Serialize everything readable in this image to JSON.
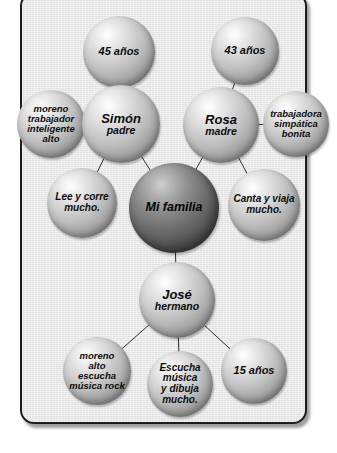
{
  "diagram": {
    "title": "Mi familia",
    "type": "family-mind-map",
    "language": "es",
    "panel": {
      "background_color": "#e9e9e9",
      "border_color": "#1c1c1c"
    },
    "nodes": [
      {
        "id": "age-father",
        "name": "age-father-bubble",
        "lines": [
          "45 años"
        ],
        "style": "light",
        "cx": 119,
        "cy": 52,
        "r": 36
      },
      {
        "id": "age-mother",
        "name": "age-mother-bubble",
        "lines": [
          "43 años"
        ],
        "style": "light",
        "cx": 245,
        "cy": 51,
        "r": 34
      },
      {
        "id": "traits-father",
        "name": "father-traits-bubble",
        "lines": [
          "moreno",
          "trabajador",
          "inteligente",
          "alto"
        ],
        "style": "light",
        "cx": 51,
        "cy": 124,
        "r": 34
      },
      {
        "id": "father",
        "name": "father-bubble",
        "lines": [
          "Simón",
          "padre"
        ],
        "style": "light",
        "cx": 121,
        "cy": 124,
        "r": 39
      },
      {
        "id": "mother",
        "name": "mother-bubble",
        "lines": [
          "Rosa",
          "madre"
        ],
        "style": "light",
        "cx": 221,
        "cy": 125,
        "r": 38
      },
      {
        "id": "traits-mother",
        "name": "mother-traits-bubble",
        "lines": [
          "trabajadora",
          "simpática",
          "bonita"
        ],
        "style": "light",
        "cx": 296,
        "cy": 124,
        "r": 33
      },
      {
        "id": "acts-father",
        "name": "father-activities-bubble",
        "lines": [
          "Lee y corre",
          "mucho."
        ],
        "style": "light",
        "cx": 82,
        "cy": 203,
        "r": 35
      },
      {
        "id": "center",
        "name": "center-family-bubble",
        "lines": [
          "Mi familia"
        ],
        "style": "dark",
        "cx": 174,
        "cy": 208,
        "r": 45
      },
      {
        "id": "acts-mother",
        "name": "mother-activities-bubble",
        "lines": [
          "Canta y viaja",
          "mucho."
        ],
        "style": "light",
        "cx": 264,
        "cy": 205,
        "r": 36
      },
      {
        "id": "brother",
        "name": "brother-bubble",
        "lines": [
          "José",
          "hermano"
        ],
        "style": "light",
        "cx": 177,
        "cy": 300,
        "r": 38
      },
      {
        "id": "traits-brother",
        "name": "brother-traits-bubble",
        "lines": [
          "moreno",
          "alto",
          "escucha",
          "música rock"
        ],
        "style": "light",
        "cx": 97,
        "cy": 371,
        "r": 34
      },
      {
        "id": "acts-brother",
        "name": "brother-activities-bubble",
        "lines": [
          "Escucha",
          "música",
          "y dibuja",
          "mucho."
        ],
        "style": "light",
        "cx": 180,
        "cy": 384,
        "r": 33
      },
      {
        "id": "age-brother",
        "name": "brother-age-bubble",
        "lines": [
          "15 años"
        ],
        "style": "light",
        "cx": 254,
        "cy": 371,
        "r": 33
      }
    ],
    "links": [
      {
        "name": "link-father-to-age",
        "from": "father",
        "to": "age-father"
      },
      {
        "name": "link-mother-to-age",
        "from": "mother",
        "to": "age-mother"
      },
      {
        "name": "link-father-to-traits",
        "from": "father",
        "to": "traits-father"
      },
      {
        "name": "link-mother-to-traits",
        "from": "mother",
        "to": "traits-mother"
      },
      {
        "name": "link-father-to-activities",
        "from": "father",
        "to": "acts-father"
      },
      {
        "name": "link-mother-to-activities",
        "from": "mother",
        "to": "acts-mother"
      },
      {
        "name": "link-center-to-father",
        "from": "center",
        "to": "father"
      },
      {
        "name": "link-center-to-mother",
        "from": "center",
        "to": "mother"
      },
      {
        "name": "link-center-to-brother",
        "from": "center",
        "to": "brother"
      },
      {
        "name": "link-brother-to-traits",
        "from": "brother",
        "to": "traits-brother"
      },
      {
        "name": "link-brother-to-activities",
        "from": "brother",
        "to": "acts-brother"
      },
      {
        "name": "link-brother-to-age",
        "from": "brother",
        "to": "age-brother"
      }
    ]
  }
}
